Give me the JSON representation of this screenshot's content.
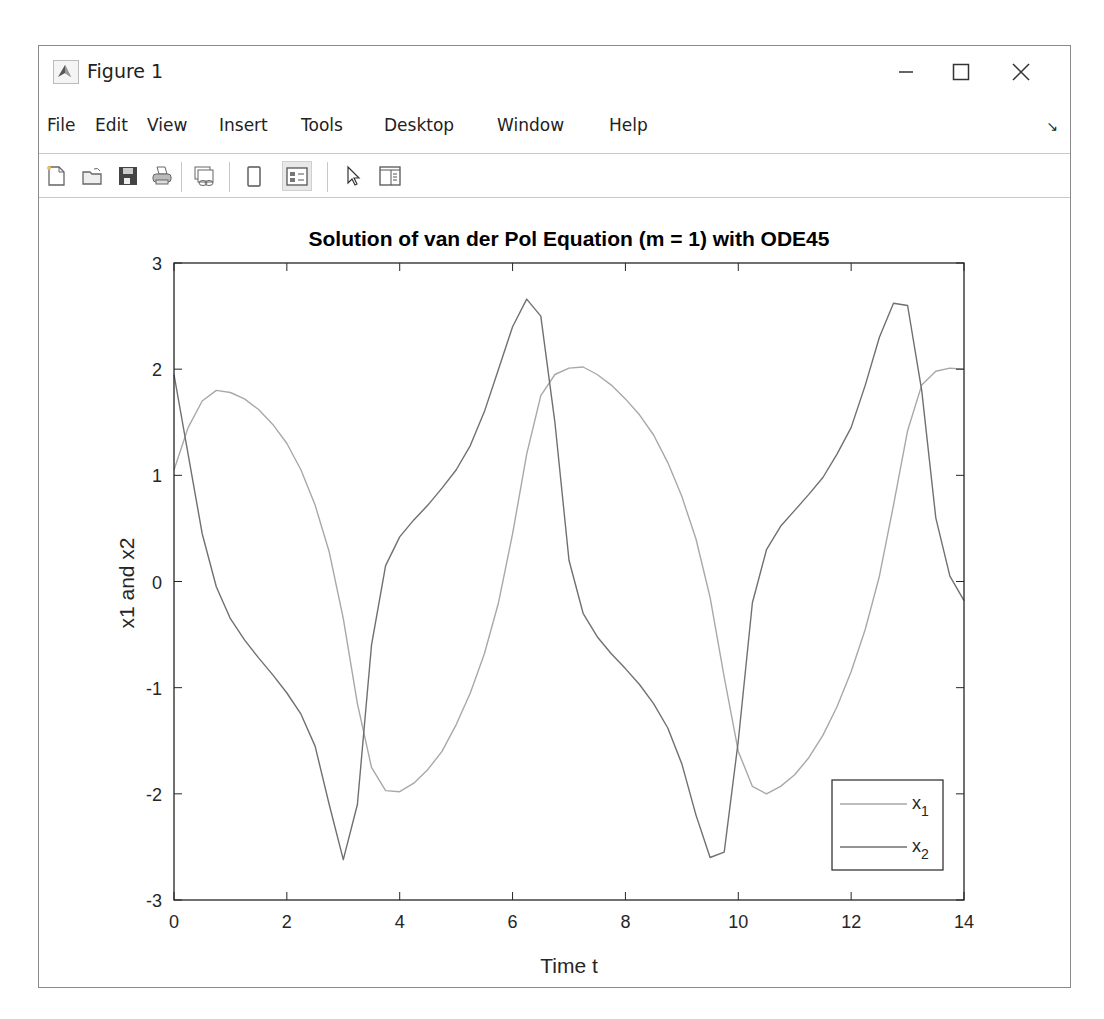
{
  "window": {
    "title": "Figure 1",
    "controls": {
      "minimize": "minimize",
      "maximize": "maximize",
      "close": "close"
    }
  },
  "menubar": {
    "items": [
      "File",
      "Edit",
      "View",
      "Insert",
      "Tools",
      "Desktop",
      "Window",
      "Help"
    ],
    "dock_icon": "dock-arrow-icon"
  },
  "toolbar": {
    "buttons": [
      {
        "name": "new-figure",
        "icon": "new-file-icon"
      },
      {
        "name": "open-file",
        "icon": "folder-open-icon"
      },
      {
        "name": "save-figure",
        "icon": "save-icon"
      },
      {
        "name": "print-figure",
        "icon": "printer-icon"
      },
      {
        "name": "link-plot",
        "icon": "link-plot-icon"
      },
      {
        "name": "hide-plot-tools",
        "icon": "hide-plot-tools-icon"
      },
      {
        "name": "show-plot-tools",
        "icon": "show-plot-tools-icon"
      },
      {
        "name": "edit-plot",
        "icon": "cursor-arrow-icon"
      },
      {
        "name": "open-property-inspector",
        "icon": "property-inspector-icon"
      }
    ]
  },
  "colors": {
    "x1_line": "#a8a8a8",
    "x2_line": "#707070",
    "axes": "#262626"
  },
  "chart_data": {
    "type": "line",
    "title": "Solution of van der Pol Equation (m = 1) with ODE45",
    "xlabel": "Time t",
    "ylabel": "x1 and x2",
    "xlim": [
      0,
      14
    ],
    "ylim": [
      -3,
      3
    ],
    "xticks": [
      0,
      2,
      4,
      6,
      8,
      10,
      12,
      14
    ],
    "yticks": [
      -3,
      -2,
      -1,
      0,
      1,
      2,
      3
    ],
    "grid": false,
    "legend_position": "lower right",
    "x": [
      0,
      0.25,
      0.5,
      0.75,
      1,
      1.25,
      1.5,
      1.75,
      2,
      2.25,
      2.5,
      2.75,
      3,
      3.25,
      3.5,
      3.75,
      4,
      4.25,
      4.5,
      4.75,
      5,
      5.25,
      5.5,
      5.75,
      6,
      6.25,
      6.5,
      6.75,
      7,
      7.25,
      7.5,
      7.75,
      8,
      8.25,
      8.5,
      8.75,
      9,
      9.25,
      9.5,
      9.75,
      10,
      10.25,
      10.5,
      10.75,
      11,
      11.25,
      11.5,
      11.75,
      12,
      12.25,
      12.5,
      12.75,
      13,
      13.25,
      13.5,
      13.75,
      14
    ],
    "series": [
      {
        "name": "x1",
        "label": "x",
        "subscript": "1",
        "values": [
          1.05,
          1.45,
          1.7,
          1.8,
          1.78,
          1.72,
          1.62,
          1.48,
          1.3,
          1.05,
          0.72,
          0.28,
          -0.35,
          -1.15,
          -1.75,
          -1.97,
          -1.98,
          -1.9,
          -1.77,
          -1.6,
          -1.35,
          -1.05,
          -0.68,
          -0.2,
          0.45,
          1.2,
          1.75,
          1.95,
          2.01,
          2.02,
          1.95,
          1.85,
          1.72,
          1.57,
          1.38,
          1.12,
          0.8,
          0.4,
          -0.15,
          -0.9,
          -1.6,
          -1.93,
          -2.0,
          -1.93,
          -1.82,
          -1.66,
          -1.45,
          -1.18,
          -0.85,
          -0.45,
          0.05,
          0.72,
          1.42,
          1.85,
          1.98,
          2.01,
          2.0
        ]
      },
      {
        "name": "x2",
        "label": "x",
        "subscript": "2",
        "values": [
          1.95,
          1.2,
          0.45,
          -0.05,
          -0.35,
          -0.55,
          -0.72,
          -0.88,
          -1.05,
          -1.25,
          -1.55,
          -2.1,
          -2.62,
          -2.1,
          -0.6,
          0.15,
          0.42,
          0.58,
          0.72,
          0.88,
          1.05,
          1.28,
          1.6,
          2.0,
          2.4,
          2.66,
          2.5,
          1.5,
          0.2,
          -0.3,
          -0.52,
          -0.68,
          -0.82,
          -0.97,
          -1.15,
          -1.38,
          -1.72,
          -2.2,
          -2.6,
          -2.55,
          -1.5,
          -0.2,
          0.3,
          0.52,
          0.67,
          0.82,
          0.98,
          1.2,
          1.45,
          1.85,
          2.3,
          2.62,
          2.6,
          1.8,
          0.6,
          0.05,
          -0.18
        ]
      }
    ]
  }
}
